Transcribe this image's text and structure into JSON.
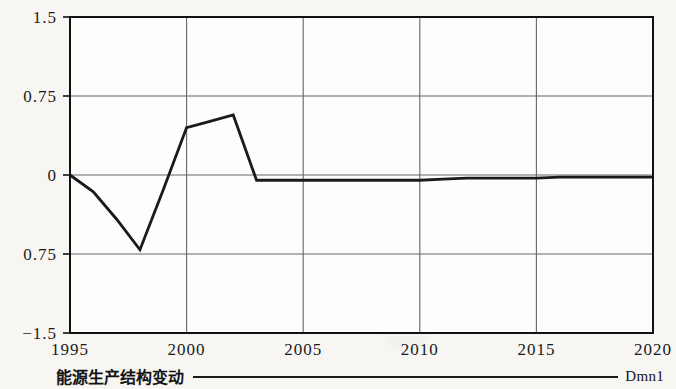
{
  "legend": {
    "series_name": "能源生产结构变动",
    "axis_name": "Dmn1",
    "line_color": "#1a1a1a"
  },
  "axis_labels": {
    "y": [
      "1.5",
      "0.75",
      "0",
      "0.75",
      "-1.5"
    ],
    "x": [
      "1995",
      "2000",
      "2005",
      "2010",
      "2015",
      "2020"
    ]
  },
  "chart_data": {
    "type": "line",
    "title": "",
    "subtitle": "",
    "xlabel": "",
    "ylabel": "",
    "xlim": [
      1995,
      2020
    ],
    "ylim": [
      -1.5,
      1.5
    ],
    "grid": true,
    "y_tick_values": [
      1.5,
      0.75,
      0,
      -0.75,
      -1.5
    ],
    "y_tick_labels": [
      "1.5",
      "0.75",
      "0",
      "0.75",
      "-1.5"
    ],
    "x_tick_values": [
      1995,
      2000,
      2005,
      2010,
      2015,
      2020
    ],
    "x_tick_labels": [
      "1995",
      "2000",
      "2005",
      "2010",
      "2015",
      "2020"
    ],
    "legend_position": "bottom",
    "legend_entries": [
      "能源生产结构变动"
    ],
    "annotations": [
      "Dmn1"
    ],
    "series": [
      {
        "name": "能源生产结构变动",
        "color": "#1a1a1a",
        "x": [
          1995,
          1996,
          1997,
          1998,
          1999,
          2000,
          2001,
          2002,
          2003,
          2004,
          2005,
          2006,
          2007,
          2008,
          2009,
          2010,
          2011,
          2012,
          2013,
          2014,
          2015,
          2016,
          2017,
          2018,
          2019,
          2020
        ],
        "values": [
          0.0,
          -0.16,
          -0.42,
          -0.71,
          -0.14,
          0.45,
          0.51,
          0.57,
          -0.05,
          -0.05,
          -0.05,
          -0.05,
          -0.05,
          -0.05,
          -0.05,
          -0.05,
          -0.04,
          -0.03,
          -0.03,
          -0.03,
          -0.03,
          -0.02,
          -0.02,
          -0.02,
          -0.02,
          -0.02
        ]
      }
    ]
  }
}
